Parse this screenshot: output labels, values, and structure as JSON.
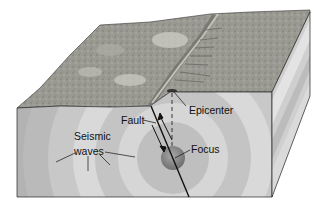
{
  "diagram": {
    "type": "earthquake block diagram",
    "labels": {
      "epicenter": "Epicenter",
      "fault": "Fault",
      "focus": "Focus",
      "seismic_line1": "Seismic",
      "seismic_line2": "waves"
    },
    "colors": {
      "background": "#ffffff",
      "terrain": "#9c9c94",
      "terrain_dark": "#7d7d76",
      "terrain_light": "#c9c9c2",
      "front_face": "#bdbdbd",
      "ring_light": "#d8d8d8",
      "ring_mid": "#c6c6c6",
      "ring_dark": "#adadad",
      "focus": "#8a8a8a",
      "line": "#111111"
    }
  }
}
